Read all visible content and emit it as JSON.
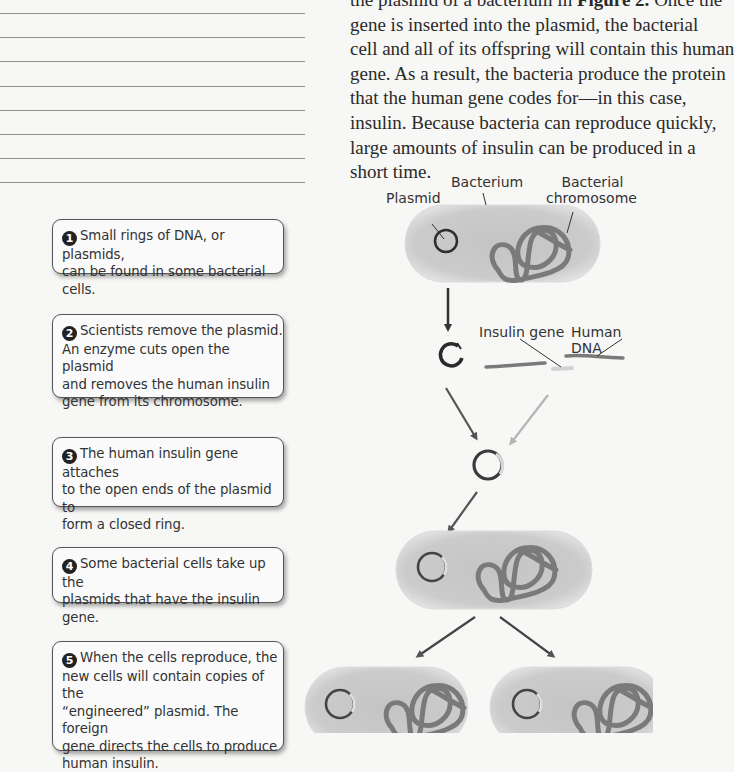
{
  "notes_lines": {
    "count": 8,
    "y_positions": [
      13,
      37,
      61,
      86,
      110,
      134,
      158,
      182
    ]
  },
  "paragraph": {
    "lines": [
      "the plasmid of a bacterium in ",
      "gene is inserted into the plasmid, the bacterial",
      "cell and all of its offspring will contain this human",
      "gene. As a result, the bacteria produce the protein",
      "that the human gene codes for—in this case,",
      "insulin. Because bacteria can reproduce quickly,",
      "large amounts of insulin can be produced in a",
      "short time."
    ],
    "figure_ref": "Figure 2.",
    "first_line_tail": " Once the"
  },
  "steps": [
    {
      "number": "1",
      "text": "Small rings of DNA, or plasmids, can be found in some bacterial cells.",
      "lines": [
        "Small rings of DNA, or plasmids,",
        "can be found in some bacterial cells."
      ]
    },
    {
      "number": "2",
      "text": "Scientists remove the plasmid. An enzyme cuts open the plasmid and removes the human insulin gene from its chromosome.",
      "lines": [
        "Scientists remove the plasmid.",
        "An enzyme cuts open the plasmid",
        "and removes the human insulin",
        "gene from its chromosome."
      ]
    },
    {
      "number": "3",
      "text": "The human insulin gene attaches to the open ends of the plasmid to form a closed ring.",
      "lines": [
        "The human insulin gene attaches",
        "to the open ends of the plasmid to",
        "form a closed ring."
      ]
    },
    {
      "number": "4",
      "text": "Some bacterial cells take up the plasmids that have the insulin gene.",
      "lines": [
        "Some bacterial cells take up the",
        "plasmids that have the insulin gene."
      ]
    },
    {
      "number": "5",
      "text": "When the cells reproduce, the new cells will contain copies of the “engineered” plasmid. The foreign gene directs the cells to produce human insulin.",
      "lines": [
        "When the cells reproduce, the",
        "new cells will contain copies of the",
        "“engineered” plasmid. The foreign",
        "gene directs the cells to produce",
        "human insulin."
      ]
    }
  ],
  "diagram": {
    "labels": {
      "plasmid": "Plasmid",
      "bacterium": "Bacterium",
      "bacterial_chromosome_line1": "Bacterial",
      "bacterial_chromosome_line2": "chromosome",
      "insulin_gene": "Insulin gene",
      "human_dna": "Human DNA"
    },
    "colors": {
      "cell_fill": "#c9c9c9",
      "cell_edge": "#e6e6e6",
      "chromosome": "#7d7d7d",
      "plasmid": "#333333",
      "insulin_gene": "#d4d4d4",
      "arrow_dark": "#3a3a3a",
      "arrow_light": "#b8b8b8"
    }
  }
}
